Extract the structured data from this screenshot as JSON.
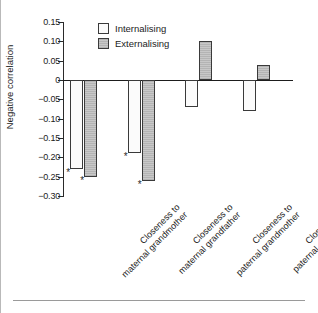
{
  "chart_data": {
    "type": "bar",
    "title": "",
    "subtitle": "",
    "xlabel": "",
    "ylabel": "Negative correlation",
    "ylim": [
      -0.3,
      0.15
    ],
    "ytick_labels": [
      "0.15",
      "0.10",
      "0.05",
      "0",
      "−0.05",
      "−0.10",
      "−0.15",
      "−0.20",
      "−0.25",
      "−0.30"
    ],
    "ytick_values": [
      0.15,
      0.1,
      0.05,
      0,
      -0.05,
      -0.1,
      -0.15,
      -0.2,
      -0.25,
      -0.3
    ],
    "grid": false,
    "legend_position": "top-left-inside",
    "categories": [
      "Closeness to maternal grandmother",
      "Closeness to maternal grandfather",
      "Closeness to paternal grandmother",
      "Closeness to paternal grandfather"
    ],
    "category_lines": [
      [
        "Closeness to",
        "maternal grandmother"
      ],
      [
        "Closeness to",
        "maternal grandfather"
      ],
      [
        "Closeness to",
        "paternal grandmother"
      ],
      [
        "Closeness to",
        "paternal grandfather"
      ]
    ],
    "series": [
      {
        "name": "Internalising",
        "color": "#fbfbfb",
        "values": [
          -0.23,
          -0.19,
          -0.07,
          -0.08
        ],
        "significance": [
          "*",
          "*",
          "",
          ""
        ]
      },
      {
        "name": "Externalising",
        "color": "#c8c8c8",
        "values": [
          -0.25,
          -0.26,
          0.1,
          0.04
        ],
        "significance": [
          "*",
          "*",
          "",
          ""
        ]
      }
    ],
    "annotations": [
      {
        "text": "*",
        "series": "Internalising",
        "category": "Closeness to maternal grandmother",
        "value": -0.23
      },
      {
        "text": "*",
        "series": "Externalising",
        "category": "Closeness to maternal grandmother",
        "value": -0.25
      },
      {
        "text": "*",
        "series": "Internalising",
        "category": "Closeness to maternal grandfather",
        "value": -0.19
      },
      {
        "text": "*",
        "series": "Externalising",
        "category": "Closeness to maternal grandfather",
        "value": -0.26
      }
    ]
  },
  "legend": {
    "items": [
      {
        "label": "Internalising",
        "swatch": "internalising"
      },
      {
        "label": "Externalising",
        "swatch": "externalising"
      }
    ]
  }
}
